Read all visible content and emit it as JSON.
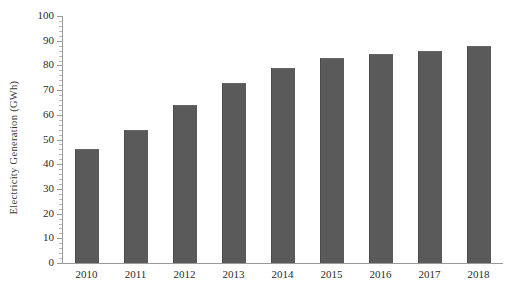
{
  "chart_data": {
    "type": "bar",
    "title": "",
    "subtitle": "",
    "xlabel": "",
    "ylabel": "Electricity  Generation  (GWh)",
    "categories": [
      "2010",
      "2011",
      "2012",
      "2013",
      "2014",
      "2015",
      "2016",
      "2017",
      "2018"
    ],
    "values": [
      46,
      54,
      64,
      73,
      79,
      83,
      84.5,
      86,
      88
    ],
    "series": [
      {
        "name": "Electricity Generation",
        "values": [
          46,
          54,
          64,
          73,
          79,
          83,
          84.5,
          86,
          88
        ]
      }
    ],
    "ylim": [
      0,
      100
    ],
    "y_major_step": 10,
    "y_minor_step": 2,
    "ytick_labels": [
      "0",
      "10",
      "20",
      "30",
      "40",
      "50",
      "60",
      "70",
      "80",
      "90",
      "100"
    ],
    "grid": false,
    "legend": false,
    "legend_position": "none",
    "bar_color": "#5a5a5a",
    "axis_color": "#9a9a9a",
    "background": "#ffffff",
    "annotations": []
  },
  "axes": {
    "y_title": "Electricity  Generation  (GWh)"
  }
}
